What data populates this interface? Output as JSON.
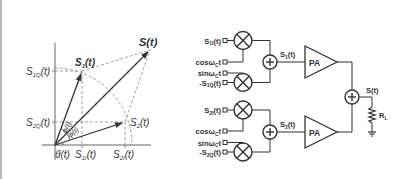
{
  "phasor_diagram": {
    "labels": {
      "s_t": "S(t)",
      "s1_t": "S",
      "s1_sub": "1",
      "s2_t": "S",
      "s2_sub": "2",
      "t_suffix": "(t)",
      "s1q": "S",
      "s1q_sub": "1Q",
      "s2q": "S",
      "s2q_sub": "2Q",
      "s1i": "S",
      "s1i_sub": "1I",
      "s2i": "S",
      "s2i_sub": "2I",
      "theta": "θ(t)",
      "phi_upper": "φ(t)",
      "phi_lower": "φ(t)"
    }
  },
  "circuit": {
    "inputs_top": [
      {
        "main": "S",
        "sub": "1I",
        "suffix": "(t)"
      },
      {
        "main": "cosω",
        "sub": "C",
        "suffix": "t"
      },
      {
        "main": "sinω",
        "sub": "C",
        "suffix": "t"
      },
      {
        "main": "-S",
        "sub": "1Q",
        "suffix": "(t)"
      }
    ],
    "inputs_bottom": [
      {
        "main": "S",
        "sub": "2I",
        "suffix": "(t)"
      },
      {
        "main": "cosω",
        "sub": "C",
        "suffix": "t"
      },
      {
        "main": "sinω",
        "sub": "C",
        "suffix": "t"
      },
      {
        "main": "-S",
        "sub": "2Q",
        "suffix": "(t)"
      }
    ],
    "signal_s1": {
      "main": "S",
      "sub": "1",
      "suffix": "(t)"
    },
    "signal_s2": {
      "main": "S",
      "sub": "2",
      "suffix": "(t)"
    },
    "pa_label": "PA",
    "output": "S(t)",
    "load": {
      "main": "R",
      "sub": "L"
    }
  }
}
